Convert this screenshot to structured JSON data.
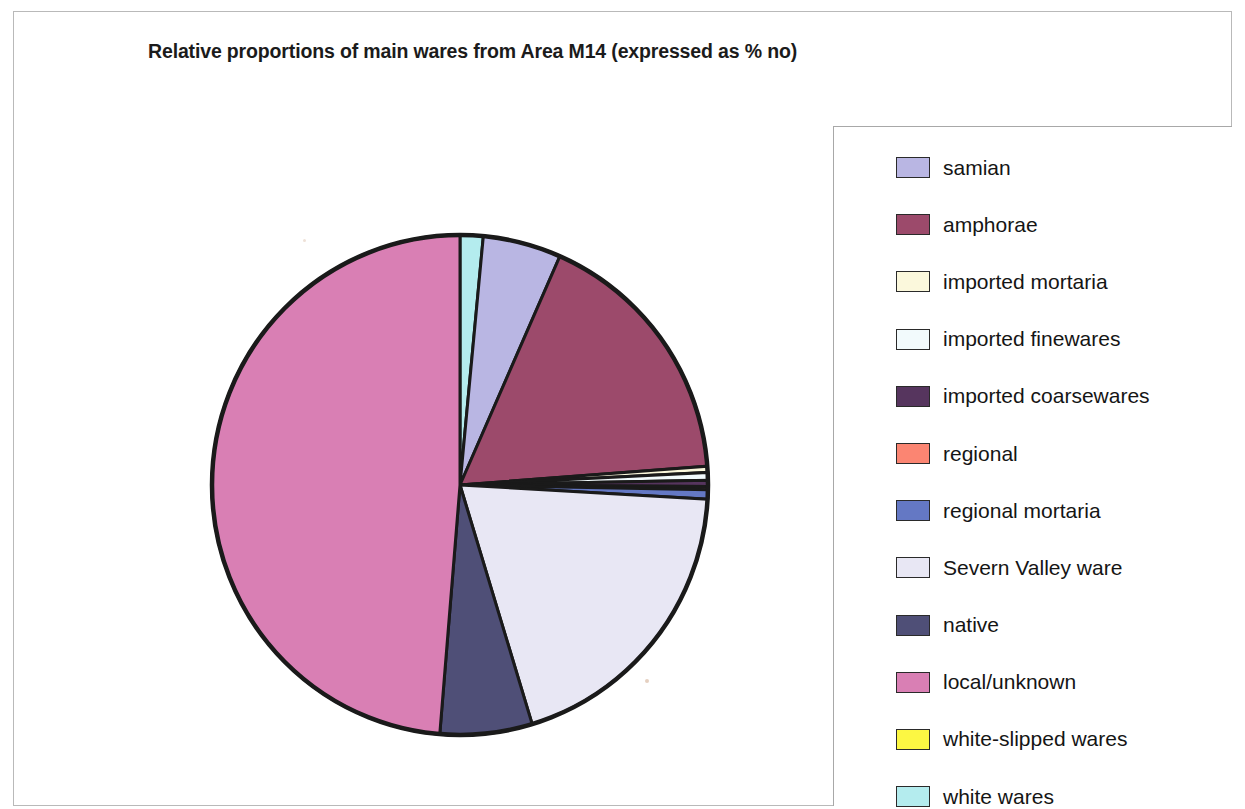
{
  "page": {
    "background_color": "#ffffff",
    "frame_color": "#b9b9b9"
  },
  "title": "Relative proportions of main wares from Area M14 (expressed as % no)",
  "legend": {
    "position": "right",
    "border_color": "#a8a8a8",
    "items": [
      {
        "label": "samian",
        "color": "#b9b6e3"
      },
      {
        "label": "amphorae",
        "color": "#9c4a6b"
      },
      {
        "label": "imported mortaria",
        "color": "#fbf8dc"
      },
      {
        "label": "imported finewares",
        "color": "#f2fafc"
      },
      {
        "label": "imported coarsewares",
        "color": "#56355e"
      },
      {
        "label": "regional",
        "color": "#fb8572"
      },
      {
        "label": "regional mortaria",
        "color": "#6478c4"
      },
      {
        "label": "Severn Valley ware",
        "color": "#e8e7f4"
      },
      {
        "label": "native",
        "color": "#4f4f77"
      },
      {
        "label": "local/unknown",
        "color": "#d97fb4"
      },
      {
        "label": "white-slipped wares",
        "color": "#fcf743"
      },
      {
        "label": "white wares",
        "color": "#b4ecee"
      }
    ]
  },
  "chart_data": {
    "type": "pie",
    "title": "Relative proportions of main wares from Area M14 (expressed as % no)",
    "units": "% no",
    "start_angle_deg": 0,
    "direction": "clockwise",
    "legend_position": "right",
    "categories": [
      "samian",
      "amphorae",
      "imported mortaria",
      "imported finewares",
      "imported coarsewares",
      "regional",
      "regional mortaria",
      "Severn Valley ware",
      "native",
      "local/unknown",
      "white-slipped wares",
      "white wares"
    ],
    "colors": [
      "#b9b6e3",
      "#9c4a6b",
      "#fbf8dc",
      "#f2fafc",
      "#56355e",
      "#fb8572",
      "#6478c4",
      "#e8e7f4",
      "#4f4f77",
      "#d97fb4",
      "#fcf743",
      "#b4ecee"
    ],
    "values": [
      5.1,
      17.2,
      0.4,
      0.5,
      0.4,
      0.2,
      0.6,
      19.4,
      6.0,
      48.7,
      0.0,
      1.5
    ],
    "slice_order_clockwise_from_12": [
      "white wares",
      "samian",
      "amphorae",
      "imported mortaria",
      "imported finewares",
      "imported coarsewares",
      "regional",
      "regional mortaria",
      "Severn Valley ware",
      "native",
      "local/unknown"
    ],
    "slice_outline_color": "#1a1a1a",
    "pie_center": [
      460,
      485
    ],
    "pie_radius": 245
  }
}
